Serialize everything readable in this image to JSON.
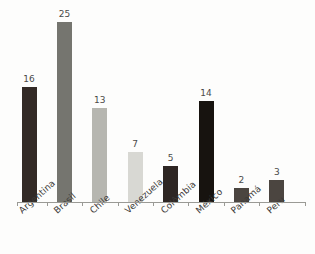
{
  "title_remnant": "",
  "chart_data": {
    "type": "bar",
    "title": "",
    "subtitle": "",
    "xlabel": "",
    "ylabel": "",
    "ylim": [
      0,
      25
    ],
    "grid": false,
    "legend": false,
    "legend_position": "none",
    "axis": {
      "show_x_axis_line": true,
      "show_y_axis_line": false,
      "tick_marks": "between-categories",
      "x_label_rotation_deg": -42
    },
    "categories": [
      "Argentina",
      "Brasil",
      "Chile",
      "Venezuela",
      "Colômbia",
      "México",
      "Panamá",
      "Peru"
    ],
    "values": [
      16,
      25,
      13,
      7,
      5,
      14,
      2,
      3
    ],
    "value_labels": [
      "16",
      "25",
      "13",
      "7",
      "5",
      "14",
      "2",
      "3"
    ],
    "bar_colors": [
      "#332a26",
      "#75756f",
      "#b6b6b0",
      "#d8d8d3",
      "#2e2623",
      "#17130f",
      "#4b4540",
      "#4b4540"
    ],
    "bars": [
      {
        "category": "Argentina",
        "value": 16,
        "label": "16",
        "color": "#332a26"
      },
      {
        "category": "Brasil",
        "value": 25,
        "label": "25",
        "color": "#75756f"
      },
      {
        "category": "Chile",
        "value": 13,
        "label": "13",
        "color": "#b6b6b0"
      },
      {
        "category": "Venezuela",
        "value": 7,
        "label": "7",
        "color": "#d8d8d3"
      },
      {
        "category": "Colômbia",
        "value": 5,
        "label": "5",
        "color": "#2e2623"
      },
      {
        "category": "México",
        "value": 14,
        "label": "14",
        "color": "#17130f"
      },
      {
        "category": "Panamá",
        "value": 2,
        "label": "2",
        "color": "#4b4540"
      },
      {
        "category": "Peru",
        "value": 3,
        "label": "3",
        "color": "#4b4540"
      }
    ]
  },
  "colors": {
    "background": "#fdfdfc",
    "axis": "#9a9a95",
    "value_label": "#4a4a48",
    "category_label": "#3c3a38"
  }
}
